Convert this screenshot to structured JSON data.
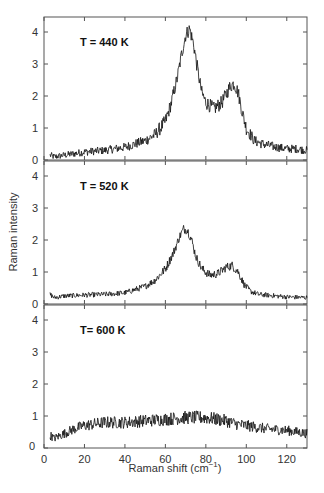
{
  "chart_data": {
    "type": "line",
    "title": "",
    "xlabel": "Raman shift (cm⁻¹)",
    "ylabel": "Raman intensity",
    "xlim": [
      0,
      130
    ],
    "ylim": [
      0,
      4.5
    ],
    "xticks": [
      0,
      20,
      40,
      60,
      80,
      100,
      120
    ],
    "yticks": [
      0,
      1,
      2,
      3,
      4
    ],
    "grid": false,
    "legend": null,
    "layout": "3 vertically stacked panels sharing x-axis",
    "panels": [
      {
        "label": "T = 440 K",
        "noise": 0.22,
        "x": [
          3,
          5,
          10,
          20,
          30,
          40,
          50,
          55,
          60,
          63,
          66,
          68,
          70,
          72,
          74,
          76,
          78,
          80,
          84,
          88,
          92,
          94,
          96,
          98,
          100,
          104,
          108,
          115,
          120,
          125,
          130
        ],
        "values": [
          0.15,
          0.1,
          0.15,
          0.25,
          0.3,
          0.4,
          0.6,
          0.8,
          1.2,
          1.8,
          2.6,
          3.3,
          3.9,
          4.1,
          3.6,
          2.8,
          2.1,
          1.8,
          1.6,
          1.8,
          2.3,
          2.4,
          2.1,
          1.5,
          1.0,
          0.6,
          0.5,
          0.4,
          0.35,
          0.35,
          0.3
        ]
      },
      {
        "label": "T = 520 K",
        "noise": 0.14,
        "x": [
          3,
          5,
          10,
          20,
          30,
          40,
          50,
          55,
          60,
          64,
          67,
          69,
          71,
          73,
          75,
          78,
          82,
          86,
          90,
          93,
          96,
          99,
          102,
          106,
          110,
          120,
          130
        ],
        "values": [
          0.3,
          0.2,
          0.25,
          0.28,
          0.3,
          0.35,
          0.55,
          0.75,
          1.1,
          1.6,
          2.1,
          2.35,
          2.3,
          2.0,
          1.5,
          1.1,
          0.9,
          0.95,
          1.15,
          1.2,
          1.0,
          0.6,
          0.4,
          0.3,
          0.28,
          0.22,
          0.2
        ]
      },
      {
        "label": "T= 600 K",
        "noise": 0.22,
        "x": [
          3,
          5,
          10,
          15,
          20,
          30,
          40,
          50,
          60,
          70,
          80,
          90,
          95,
          100,
          110,
          120,
          130
        ],
        "values": [
          0.4,
          0.3,
          0.45,
          0.6,
          0.7,
          0.8,
          0.8,
          0.85,
          0.9,
          0.95,
          0.95,
          0.85,
          0.75,
          0.7,
          0.6,
          0.55,
          0.45
        ]
      }
    ]
  },
  "figure": {
    "ylabel": "Raman intensity",
    "xlabel_main": "Raman shift (cm",
    "xlabel_sup": "−1",
    "xlabel_close": ")"
  }
}
